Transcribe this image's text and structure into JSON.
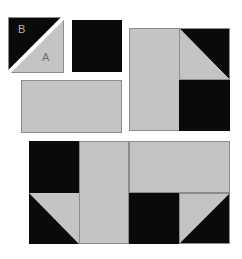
{
  "colors": {
    "light_fabric": "#c4c4c4",
    "dark_fabric": "#0a0a0a",
    "seam": "#8c8c8c",
    "background": "#ffffff",
    "label_on_dark": "#b8b8b8",
    "label_on_light": "#6e6e6e"
  },
  "pieces": {
    "half_square_triangle": {
      "label_dark": "B",
      "label_light": "A"
    }
  },
  "units": [
    {
      "name": "half-square-triangle-unit",
      "parts": [
        "dark triangle B (top-left)",
        "light triangle A (bottom-right)"
      ]
    },
    {
      "name": "dark-square",
      "parts": [
        "dark square"
      ]
    },
    {
      "name": "light-rectangle",
      "parts": [
        "light rectangle"
      ]
    },
    {
      "name": "assembled-block-top",
      "parts": [
        "light rectangle (left, vertical)",
        "HST (dark top-right)",
        "dark square"
      ]
    },
    {
      "name": "assembled-block-bottom",
      "parts": [
        "dark square",
        "HST (dark bottom-left)",
        "light rectangle (vertical)",
        "light rectangle (horizontal)",
        "dark square",
        "HST (dark bottom-right)"
      ]
    }
  ]
}
